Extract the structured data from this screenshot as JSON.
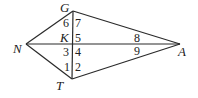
{
  "diagram": {
    "type": "kite geometry figure",
    "points": {
      "G": {
        "label": "G",
        "x": 73,
        "y": 11
      },
      "T": {
        "label": "T",
        "x": 72,
        "y": 79
      },
      "N": {
        "label": "N",
        "x": 26,
        "y": 44
      },
      "A": {
        "label": "A",
        "x": 180,
        "y": 44
      },
      "K": {
        "label": "K",
        "x": 72,
        "y": 44
      }
    },
    "segments": [
      {
        "name": "GN",
        "from": "G",
        "to": "N"
      },
      {
        "name": "NT",
        "from": "N",
        "to": "T"
      },
      {
        "name": "GA",
        "from": "G",
        "to": "A"
      },
      {
        "name": "TA",
        "from": "T",
        "to": "A"
      },
      {
        "name": "GT",
        "from": "G",
        "to": "T"
      },
      {
        "name": "NA",
        "from": "N",
        "to": "A"
      }
    ],
    "angle_labels": [
      "1",
      "2",
      "3",
      "4",
      "5",
      "6",
      "7",
      "8",
      "9"
    ],
    "text": {
      "G": "G",
      "K": "K",
      "N": "N",
      "T": "T",
      "A": "A",
      "a1": "1",
      "a2": "2",
      "a3": "3",
      "a4": "4",
      "a5": "5",
      "a6": "6",
      "a7": "7",
      "a8": "8",
      "a9": "9"
    }
  }
}
